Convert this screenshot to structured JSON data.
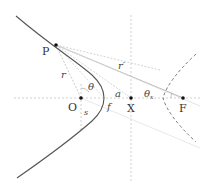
{
  "diagram": {
    "type": "hyperbola-geometry",
    "colors": {
      "curve": "#555555",
      "dashed_branch": "#777777",
      "guide": "#bbbbbb",
      "point": "#111111",
      "label": "#333333"
    },
    "points": {
      "P": {
        "label": "P",
        "x": 56,
        "y": 45
      },
      "O": {
        "label": "O",
        "x": 81,
        "y": 98
      },
      "X": {
        "label": "X",
        "x": 131,
        "y": 98
      },
      "F": {
        "label": "F",
        "x": 183,
        "y": 98
      }
    },
    "labels": {
      "r": "r",
      "r_prime": "r′",
      "theta": "θ",
      "theta_x": "θ",
      "theta_x_sub": "x",
      "a": "a",
      "f": "f",
      "s": "s"
    }
  }
}
